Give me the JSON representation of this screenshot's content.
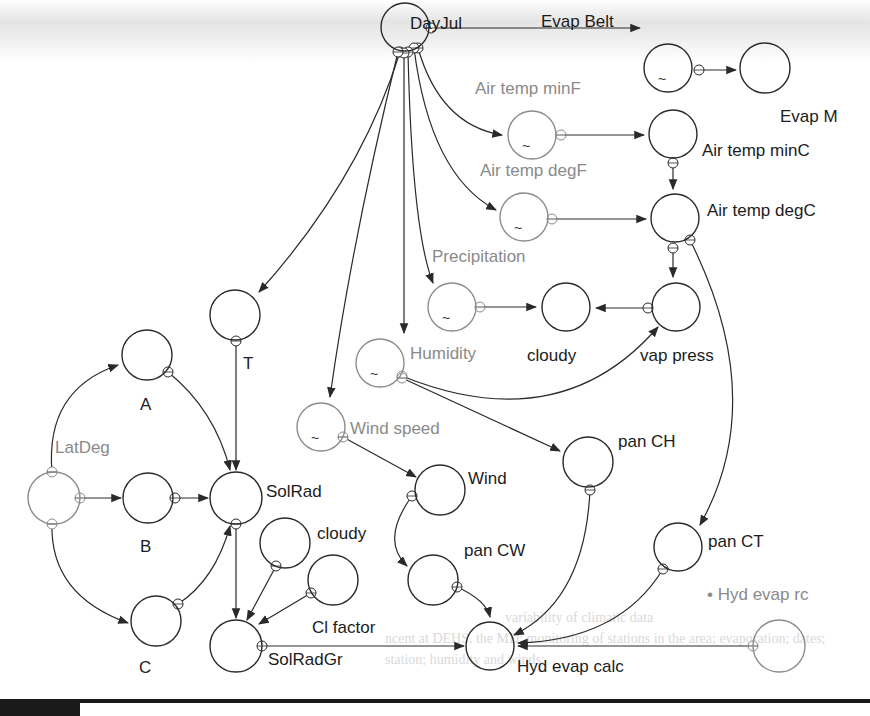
{
  "diagram": {
    "title": "",
    "colors": {
      "stroke": "#2a2a2a",
      "gray_stroke": "#8c8c8c",
      "label": "#1c1c1c",
      "gray_label": "#8a8a8a"
    },
    "nodes": [
      {
        "id": "dayjul",
        "label": "DayJul",
        "cx": 405,
        "cy": 27,
        "r": 24,
        "lx": 410,
        "ly": 29,
        "gray": false,
        "tilde": false
      },
      {
        "id": "evap_belt",
        "label": "Evap Belt",
        "cx": 668,
        "cy": 68,
        "r": 24,
        "lx": 541,
        "ly": 27,
        "gray": false,
        "tilde": true
      },
      {
        "id": "evap_m",
        "label": "Evap M",
        "cx": 765,
        "cy": 68,
        "r": 25,
        "lx": 780,
        "ly": 122,
        "gray": false,
        "tilde": false
      },
      {
        "id": "air_temp_minf",
        "label": "Air temp minF",
        "cx": 532,
        "cy": 135,
        "r": 24,
        "lx": 475,
        "ly": 94,
        "gray": true,
        "tilde": true
      },
      {
        "id": "air_temp_minc",
        "label": "Air temp minC",
        "cx": 673,
        "cy": 134,
        "r": 24,
        "lx": 702,
        "ly": 156,
        "gray": false,
        "tilde": false
      },
      {
        "id": "air_temp_degf",
        "label": "Air temp degF",
        "cx": 524,
        "cy": 217,
        "r": 24,
        "lx": 480,
        "ly": 176,
        "gray": true,
        "tilde": true
      },
      {
        "id": "air_temp_degc",
        "label": "Air temp degC",
        "cx": 675,
        "cy": 218,
        "r": 24,
        "lx": 707,
        "ly": 216,
        "gray": false,
        "tilde": false
      },
      {
        "id": "precipitation",
        "label": "Precipitation",
        "cx": 452,
        "cy": 307,
        "r": 24,
        "lx": 432,
        "ly": 262,
        "gray": true,
        "tilde": true
      },
      {
        "id": "cloudy_top",
        "label": "cloudy",
        "cx": 566,
        "cy": 307,
        "r": 24,
        "lx": 527,
        "ly": 361,
        "gray": false,
        "tilde": false
      },
      {
        "id": "vap_press",
        "label": "vap press",
        "cx": 676,
        "cy": 307,
        "r": 24,
        "lx": 640,
        "ly": 361,
        "gray": false,
        "tilde": false
      },
      {
        "id": "t",
        "label": "T",
        "cx": 235,
        "cy": 315,
        "r": 25,
        "lx": 243,
        "ly": 369,
        "gray": false,
        "tilde": false
      },
      {
        "id": "humidity",
        "label": "Humidity",
        "cx": 380,
        "cy": 363,
        "r": 24,
        "lx": 410,
        "ly": 359,
        "gray": true,
        "tilde": true
      },
      {
        "id": "a",
        "label": "A",
        "cx": 147,
        "cy": 355,
        "r": 25,
        "lx": 140,
        "ly": 410,
        "gray": false,
        "tilde": false
      },
      {
        "id": "wind_speed",
        "label": "Wind speed",
        "cx": 321,
        "cy": 427,
        "r": 24,
        "lx": 350,
        "ly": 434,
        "gray": true,
        "tilde": true
      },
      {
        "id": "latdeg",
        "label": "LatDeg",
        "cx": 54,
        "cy": 498,
        "r": 26,
        "lx": 55,
        "ly": 453,
        "gray": true,
        "tilde": false
      },
      {
        "id": "b",
        "label": "B",
        "cx": 148,
        "cy": 498,
        "r": 25,
        "lx": 140,
        "ly": 552,
        "gray": false,
        "tilde": false
      },
      {
        "id": "solrad",
        "label": "SolRad",
        "cx": 236,
        "cy": 498,
        "r": 26,
        "lx": 266,
        "ly": 497,
        "gray": false,
        "tilde": false
      },
      {
        "id": "wind",
        "label": "Wind",
        "cx": 440,
        "cy": 490,
        "r": 25,
        "lx": 468,
        "ly": 484,
        "gray": false,
        "tilde": false
      },
      {
        "id": "pan_ch",
        "label": "pan CH",
        "cx": 588,
        "cy": 462,
        "r": 25,
        "lx": 618,
        "ly": 447,
        "gray": false,
        "tilde": false
      },
      {
        "id": "cloudy_low",
        "label": "cloudy",
        "cx": 285,
        "cy": 543,
        "r": 25,
        "lx": 317,
        "ly": 539,
        "gray": false,
        "tilde": false
      },
      {
        "id": "cl_factor",
        "label": "Cl factor",
        "cx": 333,
        "cy": 580,
        "r": 25,
        "lx": 312,
        "ly": 633,
        "gray": false,
        "tilde": false
      },
      {
        "id": "pan_cw",
        "label": "pan CW",
        "cx": 433,
        "cy": 580,
        "r": 25,
        "lx": 464,
        "ly": 556,
        "gray": false,
        "tilde": false
      },
      {
        "id": "pan_ct",
        "label": "pan CT",
        "cx": 678,
        "cy": 547,
        "r": 24,
        "lx": 708,
        "ly": 547,
        "gray": false,
        "tilde": false
      },
      {
        "id": "c",
        "label": "C",
        "cx": 156,
        "cy": 621,
        "r": 25,
        "lx": 139,
        "ly": 673,
        "gray": false,
        "tilde": false
      },
      {
        "id": "solradgr",
        "label": "SolRadGr",
        "cx": 236,
        "cy": 646,
        "r": 26,
        "lx": 268,
        "ly": 665,
        "gray": false,
        "tilde": false
      },
      {
        "id": "hyd_evap_calc",
        "label": "Hyd evap calc",
        "cx": 490,
        "cy": 646,
        "r": 24,
        "lx": 517,
        "ly": 672,
        "gray": false,
        "tilde": false
      },
      {
        "id": "hyd_evap_rc",
        "label": "• Hyd evap rc",
        "cx": 779,
        "cy": 646,
        "r": 26,
        "lx": 707,
        "ly": 600,
        "gray": true,
        "tilde": false
      }
    ],
    "edges": [
      {
        "from": "dayjul",
        "to": "evap_belt",
        "path": "M 431 28 L 640 28"
      },
      {
        "from": "evap_belt",
        "to": "evap_m",
        "path": "M 699 70 L 736 70"
      },
      {
        "from": "dayjul",
        "to": "air_temp_minf",
        "path": "M 418 48 Q 440 125 502 135"
      },
      {
        "from": "air_temp_minf",
        "to": "air_temp_minc",
        "path": "M 561 135 L 644 135"
      },
      {
        "from": "air_temp_minc",
        "to": "air_temp_degc",
        "path": "M 673 163 L 673 189"
      },
      {
        "from": "dayjul",
        "to": "air_temp_degf",
        "path": "M 414 48 Q 430 175 496 210"
      },
      {
        "from": "air_temp_degf",
        "to": "air_temp_degc",
        "path": "M 552 219 L 646 219"
      },
      {
        "from": "air_temp_degc",
        "to": "vap_press",
        "path": "M 673 248 L 673 277"
      },
      {
        "from": "dayjul",
        "to": "precipitation",
        "path": "M 408 52 Q 412 230 433 283"
      },
      {
        "from": "precipitation",
        "to": "cloudy_top",
        "path": "M 480 307 L 536 307"
      },
      {
        "from": "vap_press",
        "to": "cloudy_top",
        "path": "M 648 308 L 596 308"
      },
      {
        "from": "dayjul",
        "to": "t",
        "path": "M 400 52 Q 360 180 259 292"
      },
      {
        "from": "dayjul",
        "to": "humidity",
        "path": "M 404 53 L 404 333"
      },
      {
        "from": "dayjul",
        "to": "wind_speed",
        "path": "M 398 52 Q 352 240 330 397"
      },
      {
        "from": "humidity",
        "to": "vap_press",
        "path": "M 402 376 Q 560 440 658 327"
      },
      {
        "from": "humidity",
        "to": "pan_ch",
        "path": "M 402 378 L 560 451"
      },
      {
        "from": "wind_speed",
        "to": "wind",
        "path": "M 343 437 L 416 477"
      },
      {
        "from": "wind",
        "to": "pan_cw",
        "path": "M 412 496 Q 380 540 407 566"
      },
      {
        "from": "pan_cw",
        "to": "hyd_evap_calc",
        "path": "M 457 587 Q 486 600 490 617"
      },
      {
        "from": "pan_ch",
        "to": "hyd_evap_calc",
        "path": "M 590 490 Q 585 600 514 635"
      },
      {
        "from": "air_temp_degc",
        "to": "pan_ct",
        "path": "M 690 240 Q 770 400 700 525"
      },
      {
        "from": "pan_ct",
        "to": "hyd_evap_calc",
        "path": "M 663 569 Q 620 640 518 643"
      },
      {
        "from": "hyd_evap_rc",
        "to": "hyd_evap_calc",
        "path": "M 753 646 L 518 646"
      },
      {
        "from": "latdeg",
        "to": "a",
        "path": "M 52 472 Q 45 390 118 365"
      },
      {
        "from": "latdeg",
        "to": "b",
        "path": "M 80 498 L 121 498"
      },
      {
        "from": "latdeg",
        "to": "c",
        "path": "M 52 524 Q 50 595 128 623"
      },
      {
        "from": "a",
        "to": "solrad",
        "path": "M 168 372 Q 215 410 230 470"
      },
      {
        "from": "t",
        "to": "solrad",
        "path": "M 236 341 L 236 470"
      },
      {
        "from": "b",
        "to": "solrad",
        "path": "M 175 498 L 208 498"
      },
      {
        "from": "c",
        "to": "solrad",
        "path": "M 178 604 Q 215 580 230 526"
      },
      {
        "from": "solrad",
        "to": "solradgr",
        "path": "M 236 524 L 236 618"
      },
      {
        "from": "cloudy_low",
        "to": "solradgr",
        "path": "M 276 566 L 247 620"
      },
      {
        "from": "cl_factor",
        "to": "solradgr",
        "path": "M 311 593 L 259 624"
      },
      {
        "from": "solradgr",
        "to": "hyd_evap_calc",
        "path": "M 262 646 L 464 646"
      }
    ]
  },
  "ghost_text": [
    {
      "text": "variability of climatic data",
      "x": 505,
      "y": 622
    },
    {
      "text": "ncent at DEHS, the MD; monitoring of stations in the area; evaporation; dates;",
      "x": 385,
      "y": 643
    },
    {
      "text": "station; humidity and winds;",
      "x": 385,
      "y": 664
    }
  ]
}
